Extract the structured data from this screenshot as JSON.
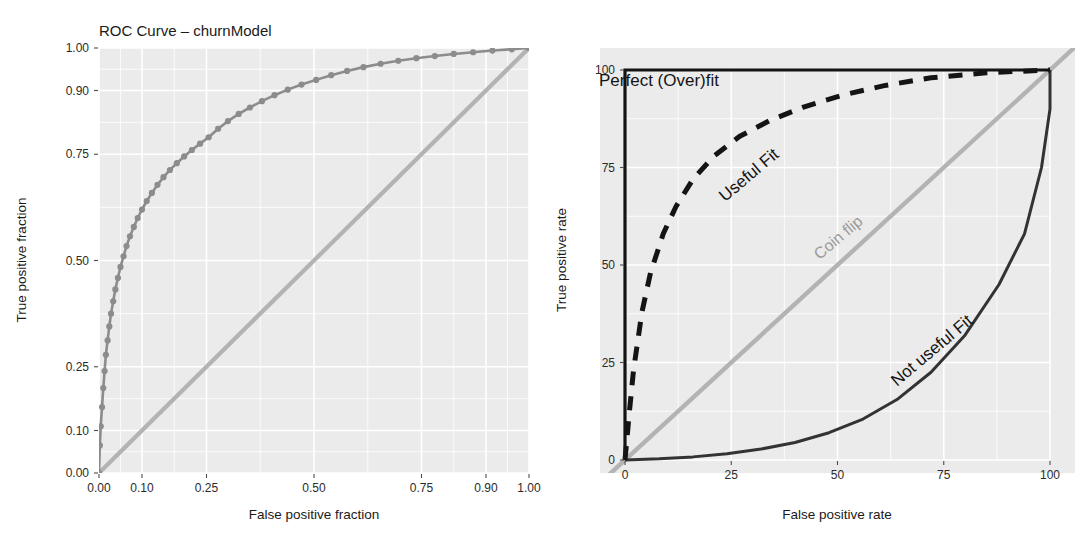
{
  "figure": {
    "background": "#ffffff",
    "panel_background": "#ebebeb",
    "gridline_color": "#ffffff"
  },
  "chart_data": [
    {
      "id": "roc-empirical",
      "type": "line",
      "title": "ROC Curve – churnModel",
      "xlabel": "False positive fraction",
      "ylabel": "True positive fraction",
      "xlim": [
        0,
        1
      ],
      "ylim": [
        0,
        1
      ],
      "xticks": [
        "0.00",
        "0.10",
        "0.25",
        "0.50",
        "0.75",
        "0.90",
        "1.00"
      ],
      "xtick_values": [
        0.0,
        0.1,
        0.25,
        0.5,
        0.75,
        0.9,
        1.0
      ],
      "yticks": [
        "0.00",
        "0.10",
        "0.25",
        "0.50",
        "0.75",
        "0.90",
        "1.00"
      ],
      "ytick_values": [
        0.0,
        0.1,
        0.25,
        0.5,
        0.75,
        0.9,
        1.0
      ],
      "grid": true,
      "legend": "none",
      "series": [
        {
          "name": "ROC curve",
          "color": "#8c8c8c",
          "marker": "circle",
          "x": [
            0.0,
            0.002,
            0.004,
            0.007,
            0.01,
            0.013,
            0.016,
            0.02,
            0.024,
            0.028,
            0.033,
            0.038,
            0.044,
            0.05,
            0.057,
            0.064,
            0.072,
            0.081,
            0.09,
            0.1,
            0.111,
            0.123,
            0.136,
            0.15,
            0.165,
            0.181,
            0.198,
            0.216,
            0.235,
            0.255,
            0.277,
            0.3,
            0.325,
            0.351,
            0.379,
            0.408,
            0.439,
            0.471,
            0.505,
            0.54,
            0.577,
            0.615,
            0.655,
            0.696,
            0.738,
            0.781,
            0.825,
            0.87,
            0.915,
            0.96,
            1.0
          ],
          "y": [
            0.0,
            0.065,
            0.11,
            0.155,
            0.2,
            0.24,
            0.278,
            0.312,
            0.345,
            0.375,
            0.404,
            0.432,
            0.459,
            0.485,
            0.51,
            0.534,
            0.557,
            0.579,
            0.6,
            0.62,
            0.64,
            0.659,
            0.678,
            0.696,
            0.713,
            0.729,
            0.745,
            0.76,
            0.775,
            0.79,
            0.81,
            0.828,
            0.845,
            0.86,
            0.875,
            0.889,
            0.902,
            0.914,
            0.925,
            0.936,
            0.946,
            0.955,
            0.963,
            0.97,
            0.976,
            0.981,
            0.986,
            0.99,
            0.994,
            0.997,
            1.0
          ]
        },
        {
          "name": "Chance diagonal",
          "color": "#b3b3b3",
          "marker": "none",
          "x": [
            -0.06,
            1.06
          ],
          "y": [
            -0.06,
            1.06
          ]
        }
      ]
    },
    {
      "id": "roc-schematic",
      "type": "line",
      "title": "",
      "xlabel": "False positive rate",
      "ylabel": "True positive rate",
      "xlim": [
        0,
        100
      ],
      "ylim": [
        0,
        100
      ],
      "xticks": [
        "0",
        "25",
        "50",
        "75",
        "100"
      ],
      "xtick_values": [
        0,
        25,
        50,
        75,
        100
      ],
      "yticks": [
        "0",
        "25",
        "50",
        "75",
        "100"
      ],
      "ytick_values": [
        0,
        25,
        50,
        75,
        100
      ],
      "grid": true,
      "legend": "none",
      "annotations": [
        {
          "text": "Perfect (Over)fit",
          "x": 8,
          "y": 96,
          "rotation": 0,
          "color": "#141414"
        },
        {
          "text": "Useful Fit",
          "x": 30,
          "y": 72,
          "rotation": -40,
          "color": "#141414"
        },
        {
          "text": "Coin flip",
          "x": 51,
          "y": 56,
          "rotation": -40,
          "color": "#9a9a9a"
        },
        {
          "text": "Not useful Fit",
          "x": 73,
          "y": 27,
          "rotation": -40,
          "color": "#333333"
        }
      ],
      "series": [
        {
          "name": "Perfect (Over)fit",
          "color": "#141414",
          "style": "solid",
          "x": [
            0,
            0,
            100
          ],
          "y": [
            0,
            100,
            100
          ]
        },
        {
          "name": "Useful Fit",
          "color": "#141414",
          "style": "dashed",
          "x": [
            0,
            1,
            2,
            4,
            6,
            9,
            12,
            16,
            21,
            27,
            34,
            42,
            51,
            61,
            72,
            85,
            100
          ],
          "y": [
            0,
            12,
            23,
            38,
            48,
            58,
            65,
            72,
            78,
            83,
            87,
            90.5,
            93.5,
            96,
            98,
            99.3,
            100
          ]
        },
        {
          "name": "Coin flip",
          "color": "#b3b3b3",
          "style": "solid",
          "x": [
            -6,
            106
          ],
          "y": [
            -6,
            106
          ]
        },
        {
          "name": "Not useful Fit",
          "color": "#333333",
          "style": "solid",
          "x": [
            0,
            8,
            16,
            24,
            32,
            40,
            48,
            56,
            64,
            72,
            80,
            88,
            94,
            98,
            100,
            100
          ],
          "y": [
            0,
            0.3,
            0.8,
            1.6,
            2.8,
            4.5,
            7.0,
            10.5,
            15.5,
            22.5,
            32.0,
            45.0,
            58.0,
            75.0,
            90.0,
            100
          ]
        }
      ]
    }
  ],
  "left_panel": {
    "title": "ROC Curve – churnModel",
    "xlabel": "False positive fraction",
    "ylabel": "True positive fraction",
    "xticks": [
      "0.00",
      "0.10",
      "0.25",
      "0.50",
      "0.75",
      "0.90",
      "1.00"
    ],
    "yticks": [
      "0.00",
      "0.10",
      "0.25",
      "0.50",
      "0.75",
      "0.90",
      "1.00"
    ]
  },
  "right_panel": {
    "xlabel": "False positive rate",
    "ylabel": "True positive rate",
    "xticks": [
      "0",
      "25",
      "50",
      "75",
      "100"
    ],
    "yticks": [
      "0",
      "25",
      "50",
      "75",
      "100"
    ],
    "annotations": {
      "perfect": "Perfect (Over)fit",
      "useful": "Useful Fit",
      "coinflip": "Coin flip",
      "notuseful": "Not useful Fit"
    }
  }
}
